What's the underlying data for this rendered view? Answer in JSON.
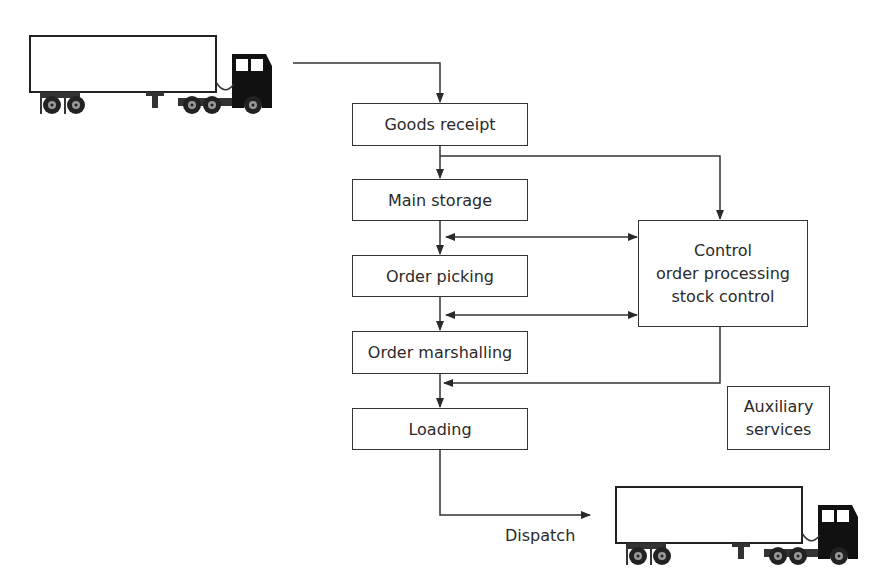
{
  "diagram": {
    "type": "warehouse-flow",
    "nodes": [
      {
        "id": "goods_receipt",
        "label": "Goods receipt"
      },
      {
        "id": "main_storage",
        "label": "Main storage"
      },
      {
        "id": "order_picking",
        "label": "Order picking"
      },
      {
        "id": "order_marshalling",
        "label": "Order marshalling"
      },
      {
        "id": "loading",
        "label": "Loading"
      },
      {
        "id": "control",
        "lines": [
          "Control",
          "order processing",
          "stock control"
        ]
      },
      {
        "id": "auxiliary",
        "lines": [
          "Auxiliary",
          "services"
        ]
      }
    ],
    "edges": [
      {
        "from": "incoming-truck",
        "to": "goods_receipt"
      },
      {
        "from": "goods_receipt",
        "to": "main_storage"
      },
      {
        "from": "goods_receipt",
        "to": "control"
      },
      {
        "from": "main_storage",
        "to": "order_picking"
      },
      {
        "from": "control",
        "to": "main-storage-order-picking-link",
        "bidirectional": true
      },
      {
        "from": "order_picking",
        "to": "order_marshalling"
      },
      {
        "from": "control",
        "to": "order-picking-marshalling-link",
        "bidirectional": true
      },
      {
        "from": "order_marshalling",
        "to": "loading"
      },
      {
        "from": "control",
        "to": "marshalling-loading-link"
      },
      {
        "from": "loading",
        "to": "outgoing-truck",
        "label": "Dispatch"
      }
    ],
    "dispatch_label": "Dispatch",
    "icons": [
      "incoming-truck-icon",
      "outgoing-truck-icon"
    ]
  }
}
